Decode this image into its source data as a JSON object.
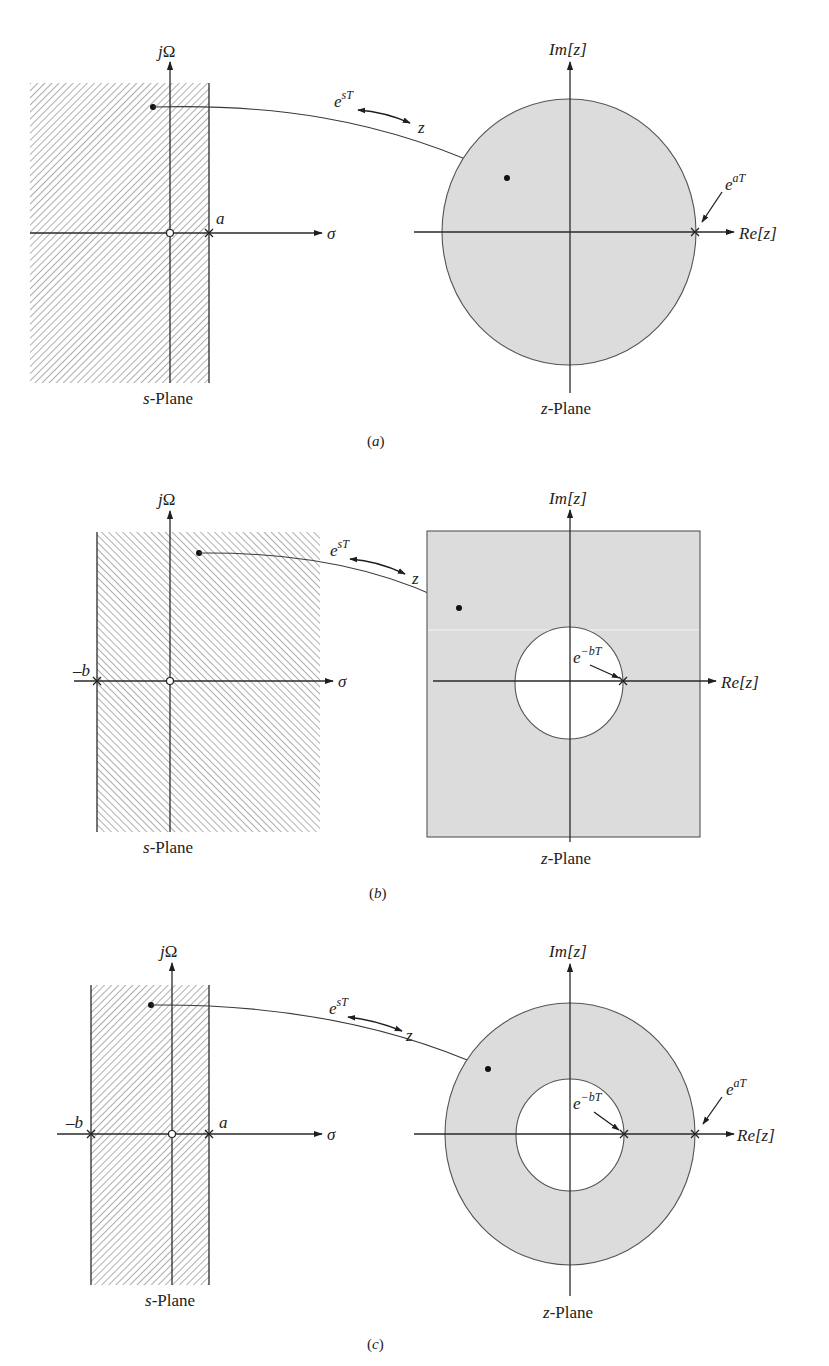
{
  "colors": {
    "region_fill": "#dcdcdc",
    "hatch": "#555555",
    "ink": "#222222",
    "background": "#ffffff"
  },
  "panels": [
    {
      "id": "a",
      "caption": "(a)",
      "s_plane": {
        "title": "s-Plane",
        "title_italic_part": "s",
        "title_rest": "-Plane",
        "vertical_axis_label": "jΩ",
        "horizontal_axis_label": "σ",
        "region": "Re[s] < a (left half-plane, hatched)",
        "hatch_direction": "forward-slash",
        "markers": [
          {
            "type": "zero-circle",
            "label": "",
            "position": "origin"
          },
          {
            "type": "pole-x",
            "label": "a",
            "position": "σ = a"
          }
        ]
      },
      "mapping": {
        "forward_label_base": "e",
        "forward_label_sup": "sT",
        "target_label": "z"
      },
      "z_plane": {
        "title": "z-Plane",
        "title_italic_part": "z",
        "title_rest": "-Plane",
        "vertical_axis_label": "Im[z]",
        "horizontal_axis_label": "Re[z]",
        "region": "|z| < e^{aT} (disk, shaded)",
        "annotations": [
          {
            "label_base": "e",
            "label_sup": "aT",
            "points_to": "outer pole on Re axis"
          }
        ]
      }
    },
    {
      "id": "b",
      "caption": "(b)",
      "s_plane": {
        "title": "s-Plane",
        "title_italic_part": "s",
        "title_rest": "-Plane",
        "vertical_axis_label": "jΩ",
        "horizontal_axis_label": "σ",
        "region": "Re[s] > -b (right half-plane, hatched)",
        "hatch_direction": "back-slash",
        "markers": [
          {
            "type": "pole-x",
            "label": "–b",
            "position": "σ = -b"
          },
          {
            "type": "zero-circle",
            "label": "",
            "position": "origin"
          }
        ]
      },
      "mapping": {
        "forward_label_base": "e",
        "forward_label_sup": "sT",
        "target_label": "z"
      },
      "z_plane": {
        "title": "z-Plane",
        "title_italic_part": "z",
        "title_rest": "-Plane",
        "vertical_axis_label": "Im[z]",
        "horizontal_axis_label": "Re[z]",
        "region": "|z| > e^{-bT} (exterior of circle, shaded)",
        "annotations": [
          {
            "label_base": "e",
            "label_sup": "−bT",
            "points_to": "inner pole on Re axis"
          }
        ]
      }
    },
    {
      "id": "c",
      "caption": "(c)",
      "s_plane": {
        "title": "s-Plane",
        "title_italic_part": "s",
        "title_rest": "-Plane",
        "vertical_axis_label": "jΩ",
        "horizontal_axis_label": "σ",
        "region": "-b < Re[s] < a (vertical strip, hatched)",
        "hatch_direction": "forward-slash",
        "markers": [
          {
            "type": "pole-x",
            "label": "–b",
            "position": "σ = -b"
          },
          {
            "type": "zero-circle",
            "label": "",
            "position": "origin"
          },
          {
            "type": "pole-x",
            "label": "a",
            "position": "σ = a"
          }
        ]
      },
      "mapping": {
        "forward_label_base": "e",
        "forward_label_sup": "sT",
        "target_label": "z"
      },
      "z_plane": {
        "title": "z-Plane",
        "title_italic_part": "z",
        "title_rest": "-Plane",
        "vertical_axis_label": "Im[z]",
        "horizontal_axis_label": "Re[z]",
        "region": "e^{-bT} < |z| < e^{aT} (annulus, shaded)",
        "annotations": [
          {
            "label_base": "e",
            "label_sup": "−bT",
            "points_to": "inner pole on Re axis"
          },
          {
            "label_base": "e",
            "label_sup": "aT",
            "points_to": "outer pole on Re axis"
          }
        ]
      }
    }
  ]
}
